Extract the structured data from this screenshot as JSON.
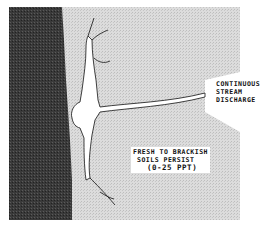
{
  "diagram": {
    "type": "coastal stream discharge schematic",
    "labels": {
      "stream": [
        "CONTINUOUS",
        "STREAM",
        "DISCHARGE"
      ],
      "soils": [
        "FRESH TO BRACKISH",
        "SOILS PERSIST",
        "(0-25 PPT)"
      ]
    },
    "colors": {
      "water": "#3a3a3a",
      "land": "#d9d9d9",
      "channel": "#ffffff",
      "outline": "#111111"
    }
  }
}
